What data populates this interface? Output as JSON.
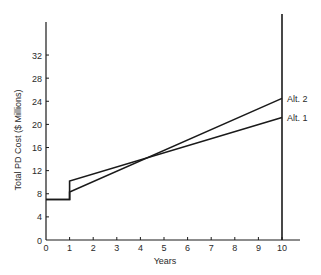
{
  "chart_data": {
    "type": "line",
    "title": "",
    "xlabel": "Years",
    "ylabel": "Total PD Cost ($ Millions)",
    "xlim": [
      0,
      10
    ],
    "ylim": [
      0,
      35
    ],
    "x_ticks": [
      "0",
      "1",
      "2",
      "3",
      "4",
      "5",
      "6",
      "7",
      "8",
      "9",
      "10"
    ],
    "y_ticks": [
      "0",
      "4",
      "8",
      "12",
      "16",
      "20",
      "24",
      "28",
      "32"
    ],
    "grid": false,
    "legend": "direct labels at right end of lines",
    "annotations": [
      "vertical line at Year 10"
    ],
    "series": [
      {
        "name": "Alt. 1",
        "points": [
          [
            0,
            7
          ],
          [
            1,
            7
          ],
          [
            1,
            10.2
          ],
          [
            10,
            21.2
          ]
        ]
      },
      {
        "name": "Alt. 2",
        "points": [
          [
            0,
            7
          ],
          [
            1,
            7
          ],
          [
            1,
            8.3
          ],
          [
            10,
            24.5
          ]
        ]
      }
    ]
  }
}
